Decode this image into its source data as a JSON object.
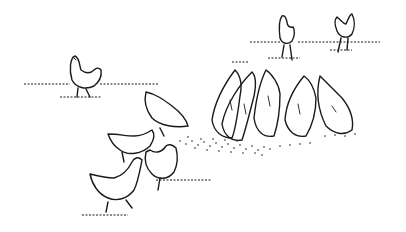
{
  "illustration": {
    "subject": "chickens pecking at scattered grain",
    "style": "black ink line drawing on white",
    "background_color": "#ffffff",
    "ink_color": "#1a1a1a",
    "chickens": [
      {
        "id": "standing-left",
        "pose": "standing"
      },
      {
        "id": "standing-top-middle",
        "pose": "standing"
      },
      {
        "id": "standing-top-right",
        "pose": "standing"
      },
      {
        "id": "pecking-group-1",
        "pose": "pecking"
      },
      {
        "id": "pecking-group-2",
        "pose": "pecking"
      },
      {
        "id": "pecking-group-3",
        "pose": "pecking"
      },
      {
        "id": "pecking-group-4",
        "pose": "pecking"
      },
      {
        "id": "pecking-group-5",
        "pose": "pecking"
      },
      {
        "id": "foreground-1",
        "pose": "pecking"
      },
      {
        "id": "foreground-2",
        "pose": "walking"
      },
      {
        "id": "foreground-3",
        "pose": "walking"
      },
      {
        "id": "foreground-4",
        "pose": "walking"
      }
    ]
  }
}
